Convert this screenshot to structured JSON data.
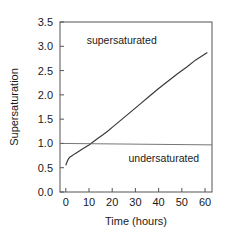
{
  "chart_data": {
    "type": "line",
    "title": "",
    "xlabel": "Time (hours)",
    "ylabel": "Supersaturation",
    "xlim": [
      -2.5,
      63
    ],
    "ylim": [
      0.0,
      3.5
    ],
    "grid": false,
    "legend": null,
    "xticks": [
      0,
      10,
      20,
      30,
      40,
      50,
      60
    ],
    "xticklabels": [
      "0",
      "10",
      "20",
      "30",
      "40",
      "50",
      "60"
    ],
    "yticks": [
      0.0,
      0.5,
      1.0,
      1.5,
      2.0,
      2.5,
      3.0,
      3.5
    ],
    "yticklabels": [
      "0.0",
      "0.5",
      "1.0",
      "1.5",
      "2.0",
      "2.5",
      "3.0",
      "3.5"
    ],
    "annotations": [
      {
        "text": "supersaturated",
        "x": 9,
        "y": 3.05
      },
      {
        "text": "undersaturated",
        "x": 27,
        "y": 0.62
      }
    ],
    "series": [
      {
        "name": "supersaturation",
        "style": "solid",
        "color": "#3a3a3a",
        "x": [
          0,
          0.6,
          1.2,
          1.8,
          2.5,
          4,
          6,
          8,
          10,
          12,
          14,
          16,
          18,
          20,
          24,
          28,
          32,
          36,
          40,
          44,
          48,
          52,
          56,
          60,
          61
        ],
        "y": [
          0.55,
          0.63,
          0.69,
          0.72,
          0.74,
          0.79,
          0.85,
          0.91,
          0.97,
          1.04,
          1.11,
          1.18,
          1.25,
          1.33,
          1.49,
          1.65,
          1.81,
          1.97,
          2.13,
          2.28,
          2.43,
          2.57,
          2.72,
          2.84,
          2.87
        ]
      },
      {
        "name": "saturation-reference",
        "style": "solid",
        "color": "#666666",
        "x": [
          -2.5,
          63
        ],
        "y": [
          1.0,
          0.97
        ]
      }
    ]
  }
}
